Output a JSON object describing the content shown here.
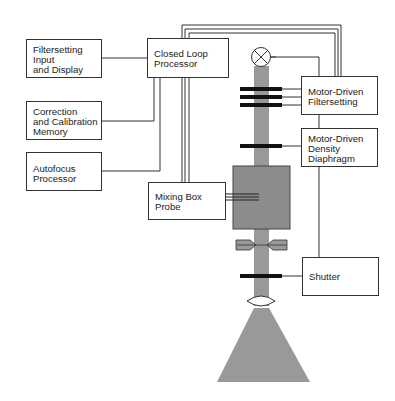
{
  "diagram": {
    "type": "block-diagram",
    "colors": {
      "line": "#333333",
      "beam": "#999999",
      "component_gray": "#8c8c8c",
      "filter_bar": "#111111"
    },
    "blocks": {
      "filtersetting_input": {
        "lines": [
          "Filtersetting",
          "Input",
          "and Display"
        ]
      },
      "correction_memory": {
        "lines": [
          "Correction",
          "and Calibration",
          "Memory"
        ]
      },
      "autofocus": {
        "lines": [
          "Autofocus",
          "Processor"
        ]
      },
      "closed_loop": {
        "lines": [
          "Closed Loop",
          "Processor"
        ]
      },
      "mixing_box_probe": {
        "lines": [
          "Mixing Box",
          "Probe"
        ]
      },
      "motor_filtersetting": {
        "lines": [
          "Motor-Driven",
          "Filtersetting"
        ]
      },
      "density_diaphragm": {
        "lines": [
          "Motor-Driven",
          "Density",
          "Diaphragm"
        ]
      },
      "shutter": {
        "lines": [
          "Shutter"
        ]
      }
    },
    "optical_elements": [
      "lamp",
      "filter-bar-1",
      "filter-bar-2",
      "filter-bar-3",
      "density-bar",
      "mixing-box",
      "aperture-blades",
      "shutter-bar",
      "lens",
      "light-cone"
    ]
  }
}
